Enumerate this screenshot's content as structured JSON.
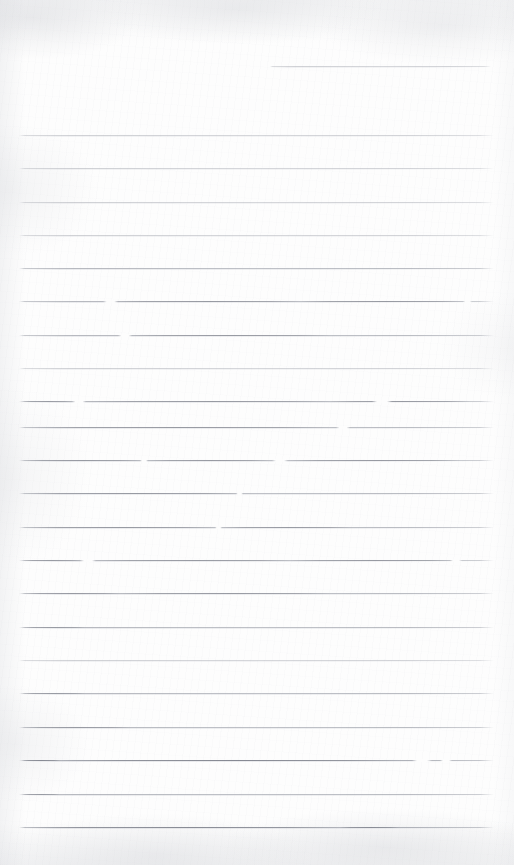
{
  "document": {
    "type": "scanned-lined-paper",
    "title": "Blank ruled notebook page",
    "description": "Scanned blank sheet of ruled (lined) writing paper with no handwriting or printed text",
    "page_width": 514,
    "page_height": 865,
    "text_content": "",
    "has_handwriting": false,
    "has_printed_text": false
  },
  "colors": {
    "paper": "#fdfdfd",
    "rule_line": "#a8abb3",
    "rule_line_dark": "#8c8f98",
    "rule_line_faint": "#cdcfd5",
    "scan_shadow": "#d0d2d7"
  },
  "ruling": {
    "style": "wide-ruled-horizontal",
    "line_count_total": 23,
    "full_width_line_count": 22,
    "partial_line_count": 1,
    "left_margin_x": 19,
    "right_margin_x": 494,
    "line_spacing_px": 33.4,
    "line_thickness_px": 1,
    "first_line_y": 66,
    "last_line_y": 827,
    "bottom_blank_margin_px": 38,
    "top_blank_margin_px": 66,
    "vertical_margin_rule": false
  },
  "lines": [
    {
      "id": "line-01",
      "y": 66,
      "x1": 270,
      "x2": 491,
      "partial": true,
      "weight": "faint",
      "segments": [],
      "gaps": []
    },
    {
      "id": "line-02",
      "y": 135,
      "x1": 19,
      "x2": 494,
      "partial": false,
      "weight": "faint",
      "segments": [],
      "gaps": []
    },
    {
      "id": "line-03",
      "y": 168,
      "x1": 19,
      "x2": 494,
      "partial": false,
      "weight": "faint",
      "segments": [],
      "gaps": []
    },
    {
      "id": "line-04",
      "y": 202,
      "x1": 19,
      "x2": 494,
      "partial": false,
      "weight": "faint",
      "segments": [],
      "gaps": []
    },
    {
      "id": "line-05",
      "y": 235,
      "x1": 19,
      "x2": 494,
      "partial": false,
      "weight": "faint",
      "segments": [],
      "gaps": []
    },
    {
      "id": "line-06",
      "y": 268,
      "x1": 19,
      "x2": 494,
      "partial": false,
      "weight": "normal",
      "segments": [],
      "gaps": []
    },
    {
      "id": "line-07",
      "y": 301,
      "x1": 19,
      "x2": 494,
      "partial": false,
      "weight": "normal",
      "segments": [
        [
          110,
          300
        ],
        [
          300,
          465
        ]
      ],
      "gaps": [
        [
          103,
          118
        ],
        [
          463,
          472
        ]
      ]
    },
    {
      "id": "line-08",
      "y": 335,
      "x1": 19,
      "x2": 494,
      "partial": false,
      "weight": "normal",
      "segments": [
        [
          128,
          330
        ]
      ],
      "gaps": [
        [
          118,
          132
        ]
      ]
    },
    {
      "id": "line-09",
      "y": 368,
      "x1": 19,
      "x2": 494,
      "partial": false,
      "weight": "faint",
      "segments": [],
      "gaps": []
    },
    {
      "id": "line-10",
      "y": 401,
      "x1": 19,
      "x2": 494,
      "partial": false,
      "weight": "normal",
      "segments": [
        [
          22,
          72
        ],
        [
          86,
          330
        ],
        [
          330,
          470
        ]
      ],
      "gaps": [
        [
          72,
          86
        ],
        [
          372,
          392
        ]
      ]
    },
    {
      "id": "line-11",
      "y": 427,
      "x1": 19,
      "x2": 494,
      "partial": false,
      "weight": "normal",
      "segments": [
        [
          22,
          330
        ]
      ],
      "gaps": [
        [
          336,
          350
        ]
      ]
    },
    {
      "id": "line-12",
      "y": 460,
      "x1": 19,
      "x2": 494,
      "partial": false,
      "weight": "normal",
      "segments": [
        [
          22,
          140
        ],
        [
          148,
          270
        ],
        [
          288,
          460
        ]
      ],
      "gaps": [
        [
          140,
          148
        ],
        [
          272,
          288
        ]
      ]
    },
    {
      "id": "line-13",
      "y": 493,
      "x1": 19,
      "x2": 494,
      "partial": false,
      "weight": "normal",
      "segments": [
        [
          22,
          240
        ]
      ],
      "gaps": [
        [
          236,
          243
        ]
      ]
    },
    {
      "id": "line-14",
      "y": 527,
      "x1": 19,
      "x2": 494,
      "partial": false,
      "weight": "normal",
      "segments": [
        [
          22,
          215
        ],
        [
          222,
          350
        ]
      ],
      "gaps": [
        [
          215,
          222
        ]
      ]
    },
    {
      "id": "line-15",
      "y": 560,
      "x1": 19,
      "x2": 494,
      "partial": false,
      "weight": "normal",
      "segments": [
        [
          22,
          80
        ],
        [
          96,
          290
        ],
        [
          290,
          455
        ]
      ],
      "gaps": [
        [
          80,
          96
        ],
        [
          450,
          462
        ]
      ]
    },
    {
      "id": "line-16",
      "y": 593,
      "x1": 19,
      "x2": 494,
      "partial": false,
      "weight": "normal",
      "segments": [
        [
          22,
          120
        ],
        [
          120,
          330
        ]
      ],
      "gaps": []
    },
    {
      "id": "line-17",
      "y": 627,
      "x1": 19,
      "x2": 494,
      "partial": false,
      "weight": "normal",
      "segments": [
        [
          22,
          85
        ]
      ],
      "gaps": []
    },
    {
      "id": "line-18",
      "y": 660,
      "x1": 19,
      "x2": 494,
      "partial": false,
      "weight": "faint",
      "segments": [],
      "gaps": []
    },
    {
      "id": "line-19",
      "y": 693,
      "x1": 19,
      "x2": 494,
      "partial": false,
      "weight": "normal",
      "segments": [
        [
          22,
          85
        ]
      ],
      "gaps": []
    },
    {
      "id": "line-20",
      "y": 727,
      "x1": 19,
      "x2": 494,
      "partial": false,
      "weight": "normal",
      "segments": [
        [
          22,
          130
        ]
      ],
      "gaps": []
    },
    {
      "id": "line-21",
      "y": 760,
      "x1": 19,
      "x2": 494,
      "partial": false,
      "weight": "dark",
      "segments": [
        [
          22,
          60
        ],
        [
          60,
          400
        ]
      ],
      "gaps": [
        [
          412,
          432
        ],
        [
          440,
          452
        ]
      ]
    },
    {
      "id": "line-22",
      "y": 794,
      "x1": 19,
      "x2": 494,
      "partial": false,
      "weight": "normal",
      "segments": [
        [
          22,
          60
        ]
      ],
      "gaps": []
    },
    {
      "id": "line-23",
      "y": 827,
      "x1": 19,
      "x2": 494,
      "partial": false,
      "weight": "dark",
      "segments": [
        [
          22,
          340
        ],
        [
          340,
          400
        ]
      ],
      "gaps": []
    }
  ]
}
